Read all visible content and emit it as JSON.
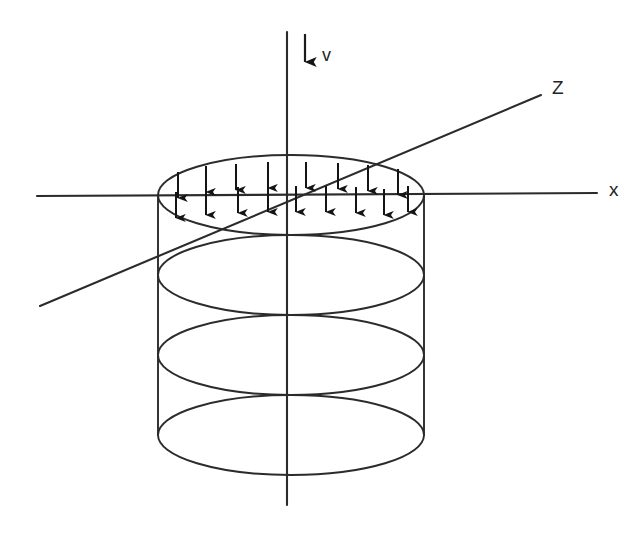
{
  "figure": {
    "background_color": "#ffffff",
    "stroke_color": "#2b2b2b",
    "width": 633,
    "height": 535
  },
  "axes": [
    {
      "id": "vertical-axis",
      "name": "vertical-axis",
      "label": "",
      "x1": 287,
      "y1": 32,
      "x2": 287,
      "y2": 505
    },
    {
      "id": "x-axis",
      "name": "x-axis",
      "label": "x",
      "label_x": 609,
      "label_y": 191,
      "x1": 37,
      "y1": 196,
      "x2": 597,
      "y2": 193
    },
    {
      "id": "z-axis",
      "name": "z-axis",
      "label": "Z",
      "label_x": 552,
      "label_y": 89,
      "x1": 40,
      "y1": 306,
      "x2": 541,
      "y2": 95
    }
  ],
  "load_vector": {
    "name": "velocity-vector",
    "label": "v",
    "label_x": 322,
    "label_y": 56,
    "x": 305,
    "y1": 34,
    "y2": 62,
    "direction": "down"
  },
  "cylinder": {
    "name": "cylinder-wireframe",
    "center_x": 291,
    "radius_x": 133,
    "radius_y": 40,
    "left_wall_x": 158,
    "right_wall_x": 424,
    "top_y": 195,
    "bottom_y": 435,
    "rings": [
      195,
      275,
      355,
      435
    ],
    "ring_count": 4
  },
  "surface_load": {
    "name": "distributed-load-arrows",
    "description": "Uniform downward arrows over the top circular face",
    "arrow_length": 26,
    "rows": [
      {
        "row": "upper",
        "arrows": [
          {
            "x": 178,
            "y_tail": 172,
            "y_head": 198
          },
          {
            "x": 206,
            "y_tail": 166,
            "y_head": 192
          },
          {
            "x": 236,
            "y_tail": 164,
            "y_head": 190
          },
          {
            "x": 268,
            "y_tail": 162,
            "y_head": 188
          },
          {
            "x": 306,
            "y_tail": 162,
            "y_head": 188
          },
          {
            "x": 338,
            "y_tail": 163,
            "y_head": 189
          },
          {
            "x": 368,
            "y_tail": 165,
            "y_head": 191
          },
          {
            "x": 398,
            "y_tail": 169,
            "y_head": 195
          }
        ]
      },
      {
        "row": "lower",
        "arrows": [
          {
            "x": 176,
            "y_tail": 192,
            "y_head": 218
          },
          {
            "x": 206,
            "y_tail": 189,
            "y_head": 215
          },
          {
            "x": 238,
            "y_tail": 187,
            "y_head": 213
          },
          {
            "x": 268,
            "y_tail": 186,
            "y_head": 212
          },
          {
            "x": 296,
            "y_tail": 186,
            "y_head": 212
          },
          {
            "x": 326,
            "y_tail": 186,
            "y_head": 212
          },
          {
            "x": 356,
            "y_tail": 187,
            "y_head": 213
          },
          {
            "x": 384,
            "y_tail": 189,
            "y_head": 215
          },
          {
            "x": 408,
            "y_tail": 186,
            "y_head": 212
          }
        ]
      }
    ]
  }
}
